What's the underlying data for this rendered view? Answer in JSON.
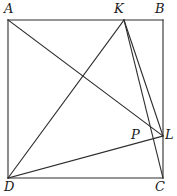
{
  "figure": {
    "width": 177,
    "height": 196,
    "background_color": "#ffffff",
    "stroke_color": "#2e2e2e",
    "stroke_width": 1.1,
    "label_color": "#1c1c1c"
  },
  "points": {
    "A": {
      "label": "A",
      "x": 8,
      "y": 20,
      "label_x": 4,
      "label_y": 2
    },
    "B": {
      "label": "B",
      "x": 163,
      "y": 20,
      "label_x": 155,
      "label_y": 2
    },
    "C": {
      "label": "C",
      "x": 163,
      "y": 178,
      "label_x": 155,
      "label_y": 180
    },
    "D": {
      "label": "D",
      "x": 8,
      "y": 178,
      "label_x": 4,
      "label_y": 180
    },
    "K": {
      "label": "K",
      "x": 124,
      "y": 20,
      "label_x": 114,
      "label_y": 2
    },
    "L": {
      "label": "L",
      "x": 163,
      "y": 136,
      "label_x": 165,
      "label_y": 128
    },
    "P": {
      "label": "P",
      "x": 146,
      "y": 139,
      "label_x": 131,
      "label_y": 128
    }
  },
  "segments": [
    {
      "name": "side-AB",
      "from": "A",
      "to": "B"
    },
    {
      "name": "side-BC",
      "from": "B",
      "to": "C"
    },
    {
      "name": "side-CD",
      "from": "C",
      "to": "D"
    },
    {
      "name": "side-DA",
      "from": "D",
      "to": "A"
    },
    {
      "name": "segment-AL",
      "from": "A",
      "to": "L"
    },
    {
      "name": "segment-DK",
      "from": "D",
      "to": "K"
    },
    {
      "name": "segment-KL",
      "from": "K",
      "to": "L"
    },
    {
      "name": "segment-KC",
      "from": "K",
      "to": "C"
    },
    {
      "name": "segment-DL",
      "from": "D",
      "to": "L"
    }
  ]
}
